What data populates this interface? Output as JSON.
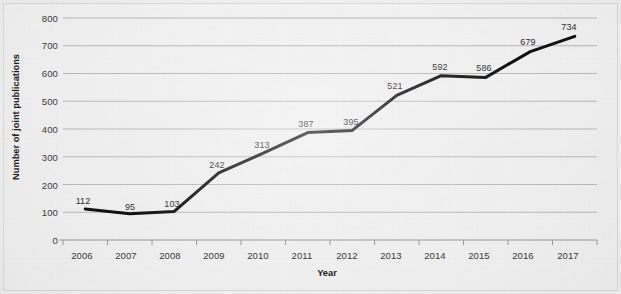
{
  "chart_data": {
    "type": "line",
    "title": "",
    "subtitle": "",
    "xlabel": "Year",
    "ylabel": "Number of joint publications",
    "categories": [
      "2006",
      "2007",
      "2008",
      "2009",
      "2010",
      "2011",
      "2012",
      "2013",
      "2014",
      "2015",
      "2016",
      "2017"
    ],
    "values": [
      112,
      95,
      103,
      242,
      313,
      387,
      395,
      521,
      592,
      586,
      679,
      734
    ],
    "series": [
      {
        "name": "Number of joint publications",
        "values": [
          112,
          95,
          103,
          242,
          313,
          387,
          395,
          521,
          592,
          586,
          679,
          734
        ],
        "color": "#111111"
      }
    ],
    "data_labels": [
      "112",
      "95",
      "103",
      "242",
      "313",
      "387",
      "395",
      "521",
      "592",
      "586",
      "679",
      "734"
    ],
    "ylim": [
      0,
      800
    ],
    "ytick_step": 100,
    "yticks": [
      "0",
      "100",
      "200",
      "300",
      "400",
      "500",
      "600",
      "700",
      "800"
    ],
    "xticks": [
      "2006",
      "2007",
      "2008",
      "2009",
      "2010",
      "2011",
      "2012",
      "2013",
      "2014",
      "2015",
      "2016",
      "2017"
    ],
    "grid": {
      "horizontal": true,
      "vertical": false,
      "color": "#b9b9b9"
    },
    "legend": {
      "visible": false,
      "position": "none"
    },
    "markers": false,
    "line_width": 3,
    "background_color": "#f1f1f1",
    "plot_background_color": "#f1f1f1",
    "axis_line_color": "#9a9a9a",
    "text_color": "#3a3a3a"
  }
}
